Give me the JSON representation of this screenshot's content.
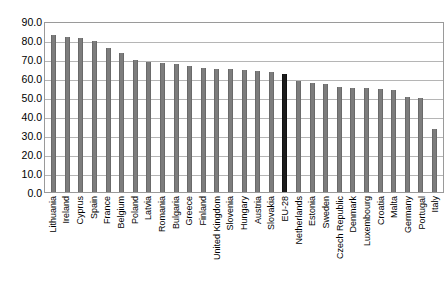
{
  "chart_data": {
    "type": "bar",
    "title": "",
    "subtitle": "",
    "xlabel": "",
    "ylabel": "",
    "ylim": [
      0,
      90
    ],
    "ytick_labels": [
      "90.0",
      "80.0",
      "70.0",
      "60.0",
      "50.0",
      "40.0",
      "30.0",
      "20.0",
      "10.0",
      "0.0"
    ],
    "ytick_values": [
      90,
      80,
      70,
      60,
      50,
      40,
      30,
      20,
      10,
      0
    ],
    "grid": true,
    "legend": "none",
    "bar_color": "#7d7d7d",
    "highlight_color": "#1c1c1c",
    "highlight_category": "EU-28",
    "categories": [
      "Lithuania",
      "Ireland",
      "Cyprus",
      "Spain",
      "France",
      "Belgium",
      "Poland",
      "Latvia",
      "Romania",
      "Bulgaria",
      "Greece",
      "Finland",
      "United Kingdom",
      "Slovenia",
      "Hungary",
      "Austria",
      "Slovakia",
      "EU-28",
      "Netherlands",
      "Estonia",
      "Sweden",
      "Czech Republic",
      "Denmark",
      "Luxembourg",
      "Croatia",
      "Malta",
      "Germany",
      "Portugal",
      "Italy"
    ],
    "values": [
      82.5,
      81.5,
      81.0,
      79.5,
      76.0,
      73.0,
      69.5,
      68.5,
      68.0,
      67.5,
      66.5,
      65.5,
      65.0,
      64.5,
      64.0,
      63.5,
      63.0,
      62.0,
      58.5,
      57.5,
      57.0,
      55.5,
      55.0,
      54.5,
      54.0,
      53.5,
      50.0,
      49.5,
      33.0
    ]
  }
}
